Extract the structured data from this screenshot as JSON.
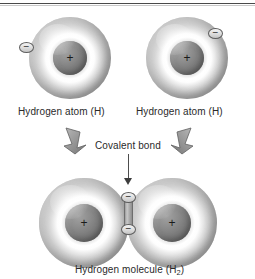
{
  "figure": {
    "background_color": "#ffffff",
    "ink_color": "#2a2a2a"
  },
  "top_row": {
    "atoms": [
      {
        "label": "Hydrogen atom (H)",
        "nucleus_charge": "+",
        "electron_charge": "−",
        "electron_position": "left"
      },
      {
        "label": "Hydrogen atom (H)",
        "nucleus_charge": "+",
        "electron_charge": "−",
        "electron_position": "upper-right"
      }
    ]
  },
  "annotation": {
    "covalent_bond_label": "Covalent bond",
    "left_arrow": "bent-arrow-down-right",
    "right_arrow": "bent-arrow-down-left",
    "pointer": "arrow-down"
  },
  "molecule": {
    "caption_text": "Hydrogen molecule (H",
    "caption_subscript": "2",
    "caption_suffix": ")",
    "caption_full": "Hydrogen molecule (H2)",
    "atoms": [
      {
        "nucleus_charge": "+"
      },
      {
        "nucleus_charge": "+"
      }
    ],
    "shared_electrons": [
      {
        "charge": "−"
      },
      {
        "charge": "−"
      }
    ]
  }
}
